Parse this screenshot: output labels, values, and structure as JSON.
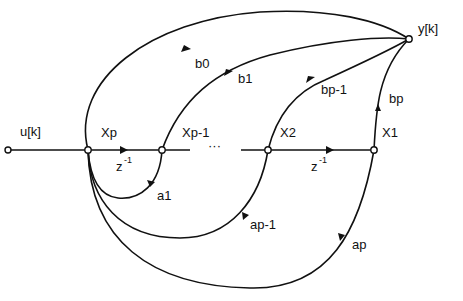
{
  "diagram": {
    "type": "signal-flow-graph",
    "input": "u[k]",
    "output": "y[k]",
    "states": [
      "Xp",
      "Xp-1",
      "X2",
      "X1"
    ],
    "delay_label": "z",
    "delay_exponent": "-1",
    "ellipsis": "···",
    "feedforward_gains": [
      "b0",
      "b1",
      "bp-1",
      "bp"
    ],
    "feedback_gains": [
      "a1",
      "ap-1",
      "ap"
    ]
  }
}
